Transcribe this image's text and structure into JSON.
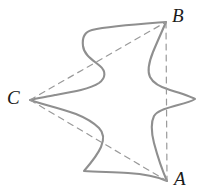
{
  "figure": {
    "kind": "geometry-diagram",
    "background_color": "#ffffff",
    "curve_color": "#8f8f8f",
    "dash_color": "#9a9a9a",
    "label_color": "#1a1a1a",
    "stroke_width": 2.1,
    "dash_width": 1.2,
    "dash_pattern": "6 5",
    "vertices": [
      {
        "id": "B",
        "label": "B",
        "x": 166,
        "y": 22,
        "label_x": 172,
        "label_y": 6
      },
      {
        "id": "C",
        "label": "C",
        "x": 30,
        "y": 100,
        "label_x": 7,
        "label_y": 88
      },
      {
        "id": "A",
        "label": "A",
        "x": 167,
        "y": 181,
        "label_x": 174,
        "label_y": 169
      }
    ],
    "dashed_chords": [
      {
        "id": "CB",
        "from": "C",
        "to": "B"
      },
      {
        "id": "CA",
        "from": "C",
        "to": "A"
      },
      {
        "id": "BA",
        "from": "B",
        "to": "A"
      }
    ],
    "outline_path": "M 166 22 C 140 24 110 26 92 30 C 84 32 82 38 83 46 C 84 55 93 60 100 66 C 106 71 106 78 99 83 C 90 89 72 92 55 95 C 46 97 37 98 30 100 C 41 104 60 108 76 114 C 86 118 93 122 99 128 C 104 133 104 140 101 147 C 97 156 90 164 84 171 C 96 172 112 172 128 173 C 146 174 158 177 167 181 C 163 172 158 158 154 143 C 151 131 151 122 154 116 C 158 110 168 108 178 105 C 186 103 192 101 195 99 C 190 96 180 93 170 90 C 160 87 153 83 150 77 C 147 71 149 62 153 52 C 158 40 163 29 166 22 Z"
  }
}
